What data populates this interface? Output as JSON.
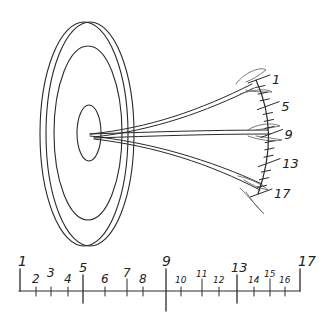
{
  "target": {
    "rings": [
      "outer-rim",
      "middle-ring",
      "bullseye"
    ]
  },
  "arc_scale": {
    "labels": [
      "1",
      "5",
      "9",
      "13",
      "17"
    ],
    "tick_count": 17
  },
  "arrows": [
    {
      "name": "arrow-top",
      "points_to": "1"
    },
    {
      "name": "arrow-middle",
      "points_to": "9"
    },
    {
      "name": "arrow-bottom",
      "points_to": "17"
    }
  ],
  "ruler": {
    "start": 1,
    "end": 17,
    "labels": [
      "1",
      "2",
      "3",
      "4",
      "5",
      "6",
      "7",
      "8",
      "9",
      "10",
      "11",
      "12",
      "13",
      "14",
      "15",
      "16",
      "17"
    ],
    "major": [
      "5",
      "9",
      "13"
    ]
  },
  "colors": {
    "ink": "#2a2a2a",
    "background": "#ffffff"
  }
}
